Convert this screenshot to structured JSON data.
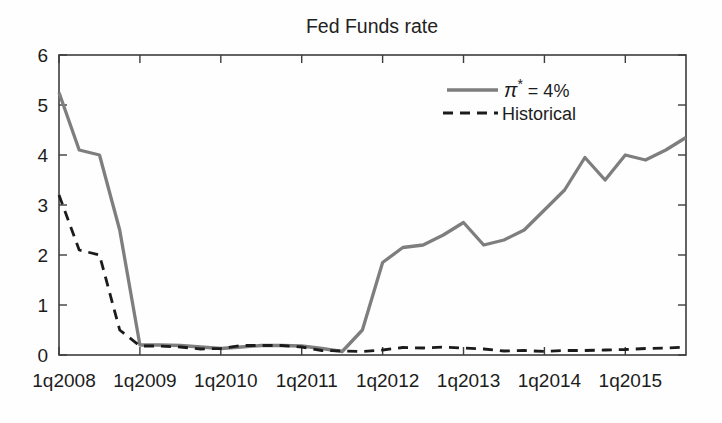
{
  "figure": {
    "background": "#fefefe",
    "axis_color": "#3d3d3d",
    "text_color": "#1c1c1c"
  },
  "chart_data": {
    "type": "line",
    "title": "Fed Funds rate",
    "xlabel": "",
    "ylabel": "",
    "grid": "off",
    "ylim": [
      0,
      6
    ],
    "yticks": [
      0,
      1,
      2,
      3,
      4,
      5,
      6
    ],
    "x_categories": [
      "1q2008",
      "2q2008",
      "3q2008",
      "4q2008",
      "1q2009",
      "2q2009",
      "3q2009",
      "4q2009",
      "1q2010",
      "2q2010",
      "3q2010",
      "4q2010",
      "1q2011",
      "2q2011",
      "3q2011",
      "4q2011",
      "1q2012",
      "2q2012",
      "3q2012",
      "4q2012",
      "1q2013",
      "2q2013",
      "3q2013",
      "4q2013",
      "1q2014",
      "2q2014",
      "3q2014",
      "4q2014",
      "1q2015",
      "2q2015",
      "3q2015",
      "4q2015"
    ],
    "x_tick_indices": [
      0,
      4,
      8,
      12,
      16,
      20,
      24,
      28
    ],
    "x_tick_labels": [
      "1q2008",
      "1q2009",
      "1q2010",
      "1q2011",
      "1q2012",
      "1q2013",
      "1q2014",
      "1q2015"
    ],
    "series": [
      {
        "name": "pi-star-4pct",
        "label": "π* = 4%",
        "style": "solid",
        "color": "#7e7e7e",
        "values": [
          5.25,
          4.1,
          4.0,
          2.5,
          0.2,
          0.2,
          0.19,
          0.16,
          0.13,
          0.16,
          0.19,
          0.19,
          0.18,
          0.13,
          0.07,
          0.5,
          1.85,
          2.15,
          2.2,
          2.4,
          2.65,
          2.2,
          2.3,
          2.5,
          2.9,
          3.3,
          3.95,
          3.5,
          4.0,
          3.9,
          4.1,
          4.35
        ]
      },
      {
        "name": "historical",
        "label": "Historical",
        "style": "dashed",
        "color": "#1b1b1b",
        "values": [
          3.2,
          2.1,
          2.0,
          0.5,
          0.18,
          0.18,
          0.16,
          0.12,
          0.13,
          0.19,
          0.19,
          0.19,
          0.16,
          0.09,
          0.08,
          0.07,
          0.1,
          0.15,
          0.14,
          0.16,
          0.14,
          0.12,
          0.08,
          0.09,
          0.07,
          0.09,
          0.09,
          0.1,
          0.11,
          0.13,
          0.14,
          0.16
        ]
      }
    ],
    "legend": {
      "box": false,
      "position": "inside-top-right",
      "entries": [
        {
          "label": "π* = 4%",
          "pi": "π",
          "star": "*",
          "rest": " = 4%"
        },
        {
          "label": "Historical"
        }
      ]
    }
  }
}
